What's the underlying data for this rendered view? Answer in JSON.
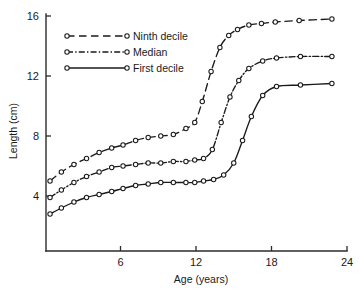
{
  "chart_data": {
    "type": "line",
    "title": "",
    "subtitle": "",
    "xlabel": "Age (years)",
    "ylabel": "Length (cm)",
    "xlim": [
      0,
      24
    ],
    "ylim": [
      0,
      16
    ],
    "xticks": [
      6,
      12,
      18,
      24
    ],
    "xtick_labels": [
      "6",
      "12",
      "18",
      "24"
    ],
    "yticks": [
      4,
      8,
      12,
      16
    ],
    "ytick_labels": [
      "4",
      "8",
      "12",
      "16"
    ],
    "grid": false,
    "legend_position": "upper-left-inside",
    "marker": "open-circle",
    "series": [
      {
        "name": "Ninth decile",
        "linestyle": "dashed",
        "color": "#1a1a1a",
        "x": [
          0.4,
          1.3,
          2.3,
          3.3,
          4.3,
          5.3,
          6.2,
          7.2,
          8.2,
          9.2,
          10.2,
          11.2,
          11.9,
          12.5,
          13.2,
          13.9,
          14.6,
          15.3,
          16.2,
          17.2,
          18.3,
          20.2,
          22.8
        ],
        "y": [
          5.0,
          5.6,
          6.1,
          6.5,
          6.9,
          7.2,
          7.4,
          7.7,
          7.9,
          8.0,
          8.1,
          8.5,
          8.9,
          10.3,
          12.3,
          13.9,
          14.7,
          15.1,
          15.4,
          15.5,
          15.6,
          15.7,
          15.8
        ]
      },
      {
        "name": "Median",
        "linestyle": "dash-dot",
        "color": "#1a1a1a",
        "x": [
          0.4,
          1.3,
          2.3,
          3.3,
          4.3,
          5.3,
          6.2,
          7.2,
          8.2,
          9.2,
          10.2,
          11.2,
          11.9,
          12.6,
          13.3,
          14.0,
          14.7,
          15.4,
          16.2,
          17.3,
          18.4,
          20.3,
          22.8
        ],
        "y": [
          3.9,
          4.4,
          4.9,
          5.3,
          5.6,
          5.9,
          6.0,
          6.1,
          6.2,
          6.2,
          6.3,
          6.3,
          6.4,
          6.5,
          7.1,
          8.9,
          10.6,
          11.7,
          12.5,
          13.0,
          13.2,
          13.3,
          13.3
        ]
      },
      {
        "name": "First decile",
        "linestyle": "solid",
        "color": "#1a1a1a",
        "x": [
          0.4,
          1.3,
          2.3,
          3.3,
          4.3,
          5.3,
          6.2,
          7.2,
          8.2,
          9.2,
          10.2,
          11.2,
          11.9,
          12.6,
          13.4,
          14.2,
          15.0,
          15.7,
          16.4,
          17.3,
          18.4,
          20.3,
          22.8
        ],
        "y": [
          2.8,
          3.2,
          3.6,
          3.9,
          4.1,
          4.3,
          4.5,
          4.7,
          4.8,
          4.9,
          4.9,
          4.9,
          4.9,
          5.0,
          5.1,
          5.4,
          6.2,
          7.7,
          9.3,
          10.7,
          11.3,
          11.4,
          11.5
        ]
      }
    ]
  },
  "legend": {
    "entries": [
      {
        "label": "Ninth decile"
      },
      {
        "label": "Median"
      },
      {
        "label": "First decile"
      }
    ]
  }
}
